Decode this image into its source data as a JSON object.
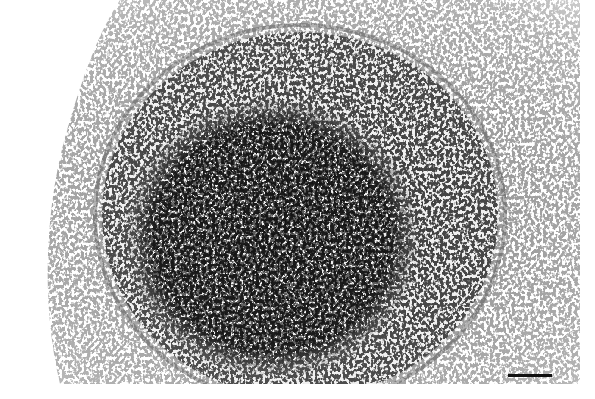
{
  "image": {
    "description": "Grayscale histology micrograph of a round cellular nodule with a dense dark core, a ring of concentrically arranged cells, surrounded by looser stromal tissue",
    "width": 580,
    "height": 384,
    "colors": {
      "background": "#ffffff",
      "dense_core": "#3a3a3a",
      "ring": "#8a8a8a",
      "stroma": "#b5b5b5",
      "nuclei": "#222222"
    },
    "regions": {
      "nodule_center": [
        270,
        240
      ],
      "core_radii": [
        145,
        135
      ],
      "ring_radii": [
        215,
        190
      ]
    }
  },
  "scale_bar": {
    "x": 508,
    "y": 374,
    "length_px": 44,
    "color": "#111111"
  }
}
